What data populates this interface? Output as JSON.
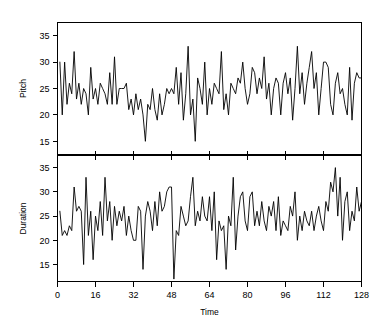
{
  "chart_data": {
    "type": "line",
    "title": "",
    "subtitle": "",
    "xlabel": "Time",
    "grid": false,
    "legend": "none",
    "panels": [
      {
        "name": "pitch",
        "ylabel": "Pitch",
        "xlabel": "",
        "xlim": [
          0,
          128
        ],
        "ylim": [
          12.5,
          37.5
        ],
        "xticks": [
          0,
          16,
          32,
          48,
          64,
          80,
          96,
          112,
          128
        ],
        "yticks": [
          15,
          20,
          25,
          30,
          35
        ],
        "ytick_labels": [
          "15",
          "20",
          "25",
          "30",
          "35"
        ],
        "x": [
          1,
          2,
          3,
          4,
          5,
          6,
          7,
          8,
          9,
          10,
          11,
          12,
          13,
          14,
          15,
          16,
          17,
          18,
          19,
          20,
          21,
          22,
          23,
          24,
          25,
          26,
          27,
          28,
          29,
          30,
          31,
          32,
          33,
          34,
          35,
          36,
          37,
          38,
          39,
          40,
          41,
          42,
          43,
          44,
          45,
          46,
          47,
          48,
          49,
          50,
          51,
          52,
          53,
          54,
          55,
          56,
          57,
          58,
          59,
          60,
          61,
          62,
          63,
          64,
          65,
          66,
          67,
          68,
          69,
          70,
          71,
          72,
          73,
          74,
          75,
          76,
          77,
          78,
          79,
          80,
          81,
          82,
          83,
          84,
          85,
          86,
          87,
          88,
          89,
          90,
          91,
          92,
          93,
          94,
          95,
          96,
          97,
          98,
          99,
          100,
          101,
          102,
          103,
          104,
          105,
          106,
          107,
          108,
          109,
          110,
          111,
          112,
          113,
          114,
          115,
          116,
          117,
          118,
          119,
          120,
          121,
          122,
          123,
          124,
          125,
          126,
          127,
          128
        ],
        "values": [
          30,
          20,
          30,
          22,
          26,
          24,
          32,
          23,
          26,
          22,
          25,
          24,
          20,
          29,
          23,
          25,
          22,
          26,
          25,
          24,
          22,
          28,
          22,
          31,
          22,
          25,
          25,
          25,
          26,
          21,
          23,
          20,
          24,
          21,
          23,
          20,
          15,
          22,
          21,
          25,
          21,
          19,
          24,
          20,
          22,
          25,
          24,
          25,
          24,
          29,
          22,
          28,
          19,
          24,
          33,
          20,
          23,
          15,
          27,
          25,
          22,
          30,
          20,
          25,
          22,
          26,
          25,
          24,
          32,
          21,
          24,
          20,
          26,
          25,
          24,
          27,
          26,
          30,
          25,
          22,
          24,
          29,
          28,
          24,
          27,
          25,
          31,
          23,
          26,
          20,
          25,
          27,
          26,
          20,
          26,
          28,
          24,
          27,
          19,
          25,
          33,
          24,
          28,
          22,
          26,
          29,
          32,
          25,
          28,
          20,
          25,
          30,
          30,
          29,
          22,
          20,
          26,
          28,
          24,
          25,
          22,
          20,
          29,
          19,
          26,
          28,
          27,
          27
        ]
      },
      {
        "name": "duration",
        "ylabel": "Duration",
        "xlabel": "Time",
        "xlim": [
          0,
          128
        ],
        "ylim": [
          11.5,
          37.5
        ],
        "xticks": [
          0,
          16,
          32,
          48,
          64,
          80,
          96,
          112,
          128
        ],
        "xtick_labels": [
          "0",
          "16",
          "32",
          "48",
          "64",
          "80",
          "96",
          "112",
          "128"
        ],
        "yticks": [
          15,
          20,
          25,
          30,
          35
        ],
        "ytick_labels": [
          "15",
          "20",
          "25",
          "30",
          "35"
        ],
        "x": [
          1,
          2,
          3,
          4,
          5,
          6,
          7,
          8,
          9,
          10,
          11,
          12,
          13,
          14,
          15,
          16,
          17,
          18,
          19,
          20,
          21,
          22,
          23,
          24,
          25,
          26,
          27,
          28,
          29,
          30,
          31,
          32,
          33,
          34,
          35,
          36,
          37,
          38,
          39,
          40,
          41,
          42,
          43,
          44,
          45,
          46,
          47,
          48,
          49,
          50,
          51,
          52,
          53,
          54,
          55,
          56,
          57,
          58,
          59,
          60,
          61,
          62,
          63,
          64,
          65,
          66,
          67,
          68,
          69,
          70,
          71,
          72,
          73,
          74,
          75,
          76,
          77,
          78,
          79,
          80,
          81,
          82,
          83,
          84,
          85,
          86,
          87,
          88,
          89,
          90,
          91,
          92,
          93,
          94,
          95,
          96,
          97,
          98,
          99,
          100,
          101,
          102,
          103,
          104,
          105,
          106,
          107,
          108,
          109,
          110,
          111,
          112,
          113,
          114,
          115,
          116,
          117,
          118,
          119,
          120,
          121,
          122,
          123,
          124,
          125,
          126,
          127,
          128
        ],
        "values": [
          26,
          21,
          22,
          21,
          23,
          22,
          31,
          26,
          27,
          26,
          15,
          33,
          21,
          26,
          16,
          25,
          22,
          28,
          21,
          33,
          24,
          28,
          20,
          27,
          23,
          26,
          24,
          27,
          21,
          25,
          22,
          20,
          20,
          27,
          26,
          14,
          25,
          28,
          26,
          22,
          28,
          23,
          30,
          26,
          27,
          30,
          31,
          31,
          12,
          22,
          21,
          27,
          25,
          23,
          24,
          29,
          33,
          23,
          26,
          24,
          29,
          25,
          24,
          29,
          22,
          30,
          16,
          24,
          22,
          23,
          14,
          25,
          23,
          33,
          18,
          25,
          29,
          30,
          24,
          22,
          29,
          30,
          23,
          26,
          23,
          28,
          24,
          22,
          27,
          25,
          28,
          22,
          29,
          21,
          24,
          23,
          22,
          27,
          25,
          30,
          20,
          25,
          22,
          26,
          24,
          23,
          26,
          22,
          25,
          27,
          24,
          22,
          28,
          26,
          32,
          30,
          35,
          25,
          33,
          20,
          28,
          30,
          22,
          26,
          24,
          31,
          26,
          28
        ]
      }
    ]
  }
}
